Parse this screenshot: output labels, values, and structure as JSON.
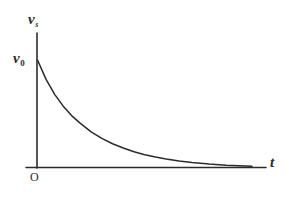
{
  "figure": {
    "caption": "",
    "background_color": "#ffffff",
    "ink_color": "#2b2b2b",
    "labels": {
      "y_axis_symbol": "v",
      "y_axis_subscript": "s",
      "y_intercept_symbol": "v",
      "y_intercept_subscript": "0",
      "origin": "O",
      "x_axis_symbol": "t"
    }
  },
  "chart_data": {
    "type": "line",
    "title": "",
    "subtitle": "",
    "xlabel": "t",
    "ylabel": "v_s",
    "grid": false,
    "legend": null,
    "annotations": [
      {
        "text": "v_0",
        "role": "y-intercept-tick-label",
        "x": 0,
        "y": 1.0
      },
      {
        "text": "O",
        "role": "origin-label",
        "x": 0,
        "y": 0
      }
    ],
    "xlim": [
      0,
      1
    ],
    "ylim": [
      0,
      1.12
    ],
    "axis_ticks": {
      "x": [],
      "y": []
    },
    "series": [
      {
        "name": "v_s(t)",
        "description": "exponential decay from v_0 toward zero asymptote",
        "color": "#2b2b2b",
        "x": [
          0.0,
          0.04,
          0.08,
          0.12,
          0.16,
          0.2,
          0.25,
          0.3,
          0.35,
          0.4,
          0.45,
          0.5,
          0.55,
          0.6,
          0.66,
          0.72,
          0.8,
          0.88,
          1.0
        ],
        "y": [
          1.0,
          0.82,
          0.68,
          0.57,
          0.48,
          0.41,
          0.33,
          0.27,
          0.22,
          0.18,
          0.145,
          0.118,
          0.096,
          0.078,
          0.06,
          0.046,
          0.031,
          0.02,
          0.01
        ]
      }
    ]
  }
}
